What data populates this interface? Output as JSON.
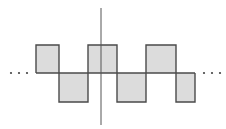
{
  "diagram": {
    "type": "square-wave",
    "colors": {
      "fill": "#dcdcdc",
      "stroke": "#4a4a4a",
      "axis": "#555555",
      "dots": "#444444"
    },
    "baseline_y": 73,
    "high_y": 45,
    "low_y": 102,
    "segments": [
      {
        "x0": 36,
        "x1": 59,
        "level": "high"
      },
      {
        "x0": 59,
        "x1": 88,
        "level": "low"
      },
      {
        "x0": 88,
        "x1": 117,
        "level": "high"
      },
      {
        "x0": 117,
        "x1": 146,
        "level": "low"
      },
      {
        "x0": 146,
        "x1": 176,
        "level": "high"
      },
      {
        "x0": 176,
        "x1": 195,
        "level": "low"
      }
    ],
    "vertical_axis": {
      "x": 101,
      "y0": 8,
      "y1": 125
    },
    "left_ellipsis": "···",
    "right_ellipsis": "···"
  }
}
